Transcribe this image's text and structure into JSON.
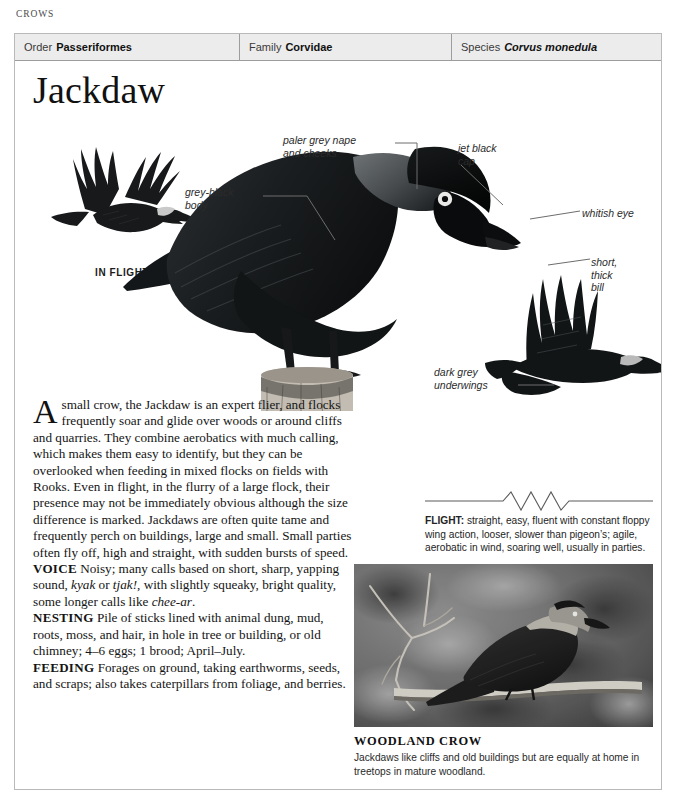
{
  "running_head": "CROWS",
  "taxonomy": {
    "order": {
      "label": "Order",
      "value": "Passeriformes"
    },
    "family": {
      "label": "Family",
      "value": "Corvidae"
    },
    "species": {
      "label": "Species",
      "value": "Corvus monedula"
    }
  },
  "title": "Jackdaw",
  "plate": {
    "in_flight_label": "IN FLIGHT",
    "callouts": {
      "grey_black_body": "grey-black\nbody",
      "paler_grey_nape": "paler grey nape\nand cheeks",
      "jet_black_cap": "jet black\ncap",
      "whitish_eye": "whitish eye",
      "short_thick_bill": "short,\nthick\nbill",
      "dark_grey_underwings": "dark grey\nunderwings"
    }
  },
  "description": {
    "dropcap": "A",
    "intro": "small crow, the Jackdaw is an expert flier, and flocks frequently soar and glide over woods or around cliffs and quarries. They combine aerobatics with much calling, which makes them easy to identify, but they can be overlooked when feeding in mixed flocks on fields with Rooks. Even in flight, in the flurry of a large flock, their presence may not be immediately obvious although the size difference is marked. Jackdaws are often quite tame and frequently perch on buildings, large and small. Small parties often fly off, high and straight, with sudden bursts of speed.",
    "sections": [
      {
        "tag": "VOICE",
        "text_parts": [
          {
            "text": "Noisy; many calls based on short, sharp, yapping sound, ",
            "italic": false
          },
          {
            "text": "kyak",
            "italic": true
          },
          {
            "text": " or ",
            "italic": false
          },
          {
            "text": "tjak!",
            "italic": true
          },
          {
            "text": ", with slightly squeaky, bright quality, some longer calls like ",
            "italic": false
          },
          {
            "text": "chee-ar",
            "italic": true
          },
          {
            "text": ".",
            "italic": false
          }
        ]
      },
      {
        "tag": "NESTING",
        "text_parts": [
          {
            "text": "Pile of sticks lined with animal dung, mud, roots, moss, and hair, in hole in tree or building, or old chimney; 4–6 eggs; 1 brood; April–July.",
            "italic": false
          }
        ]
      },
      {
        "tag": "FEEDING",
        "text_parts": [
          {
            "text": "Forages on ground, taking earthworms, seeds, and scraps; also takes caterpillars from foliage, and berries.",
            "italic": false
          }
        ]
      }
    ]
  },
  "flight": {
    "tag": "FLIGHT:",
    "text": " straight, easy, fluent with constant floppy wing action, looser, slower than pigeon’s; agile, aerobatic in wind, soaring well, usually in parties."
  },
  "photo": {
    "caption_title": "WOODLAND CROW",
    "caption_body": "Jackdaws like cliffs and old buildings but are equally at home in treetops in mature woodland."
  },
  "colors": {
    "header_band": "#ececec",
    "rule": "#9d9d9d",
    "frame": "#b9b9b9",
    "leader": "#6d6d6d",
    "ink": "#141414"
  }
}
